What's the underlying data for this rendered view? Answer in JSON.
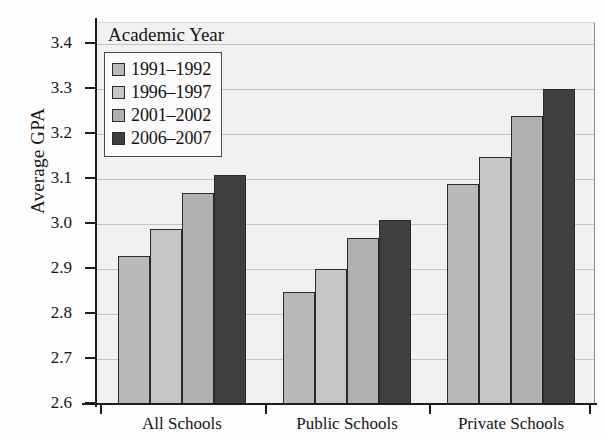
{
  "chart_data": {
    "type": "bar",
    "title": "",
    "subtitle": "",
    "xlabel": "",
    "ylabel": "Average GPA",
    "ylim": [
      2.6,
      3.4
    ],
    "ytick_step": 0.1,
    "ytick_labels": [
      "3.4",
      "3.3",
      "3.2",
      "3.1",
      "3.0",
      "2.9",
      "2.8",
      "2.7",
      "2.6"
    ],
    "grid": true,
    "grid_axis": "y",
    "legend_title": "Academic Year",
    "legend_position": "upper-left-inside",
    "categories": [
      "All Schools",
      "Public Schools",
      "Private Schools"
    ],
    "series": [
      {
        "name": "1991–1992",
        "color": "#b9b9b9",
        "values": [
          2.93,
          2.85,
          3.09
        ]
      },
      {
        "name": "1996–1997",
        "color": "#c6c6c6",
        "values": [
          2.99,
          2.9,
          3.15
        ]
      },
      {
        "name": "2001–2002",
        "color": "#b0b0b0",
        "values": [
          3.07,
          2.97,
          3.24
        ]
      },
      {
        "name": "2006–2007",
        "color": "#3f3f3f",
        "values": [
          3.11,
          3.01,
          3.3
        ]
      }
    ],
    "bar_edge_color": "#2a2a2a",
    "plot_background": "#f1f1f1",
    "gridline_color": "#c3c3c3",
    "axis_color": "#1d1d1d"
  }
}
